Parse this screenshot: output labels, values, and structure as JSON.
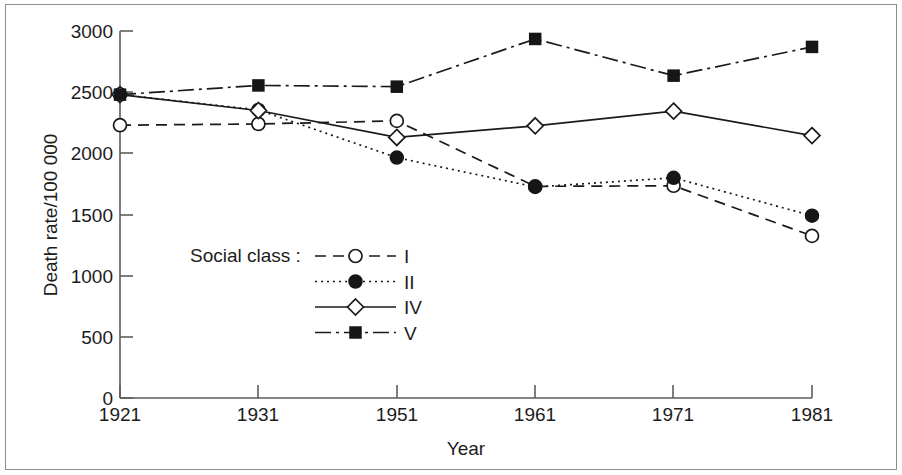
{
  "chart_data": {
    "type": "line",
    "title": "",
    "xlabel": "Year",
    "ylabel": "Death rate/100 000",
    "categories": [
      "1921",
      "1931",
      "1951",
      "1961",
      "1971",
      "1981"
    ],
    "x_tick_labels": [
      "1921",
      "1931",
      "1951",
      "1961",
      "1971",
      "1981"
    ],
    "y_tick_labels": [
      "0",
      "500",
      "1000",
      "1500",
      "2000",
      "2500",
      "3000"
    ],
    "y_ticks": [
      0,
      500,
      1000,
      1500,
      2000,
      2500,
      3000
    ],
    "ylim": [
      0,
      3000
    ],
    "grid": false,
    "legend_position": "inside-lower-left",
    "legend_title": "Social class :",
    "series": [
      {
        "name": "I",
        "label": "I",
        "marker": "open-circle",
        "linestyle": "dashed",
        "values": [
          2230,
          2240,
          2265,
          1730,
          1735,
          1325
        ]
      },
      {
        "name": "II",
        "label": "II",
        "marker": "filled-circle",
        "linestyle": "dotted",
        "values": [
          2480,
          2355,
          1965,
          1725,
          1800,
          1490
        ]
      },
      {
        "name": "IV",
        "label": "IV",
        "marker": "open-diamond",
        "linestyle": "solid",
        "values": [
          2480,
          2350,
          2130,
          2225,
          2345,
          2145
        ]
      },
      {
        "name": "V",
        "label": "V",
        "marker": "filled-square",
        "linestyle": "dash-dot",
        "values": [
          2480,
          2555,
          2545,
          2935,
          2635,
          2870
        ]
      }
    ]
  },
  "colors": {
    "ink": "#1a1a1a",
    "axis": "#5d5d5d",
    "frame": "#8d8d8d",
    "background": "#ffffff"
  }
}
